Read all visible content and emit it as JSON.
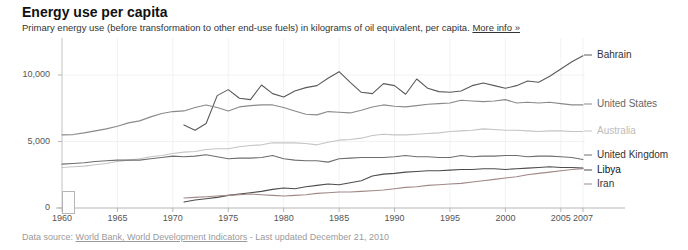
{
  "header": {
    "title": "Energy use per capita",
    "subtitle": "Primary energy use (before transformation to other end-use fuels) in kilograms of oil equivalent, per capita.",
    "more_info": "More info »"
  },
  "footer": {
    "prefix": "Data source:",
    "source_link": "World Bank, World Development Indicators",
    "updated": "- Last updated December 21, 2010"
  },
  "controls": {
    "range_handle": "range-slider-handle"
  },
  "chart_data": {
    "type": "line",
    "title": "Energy use per capita",
    "xlabel": "",
    "ylabel": "kg of oil equivalent per capita",
    "xlim": [
      1960,
      2007
    ],
    "ylim": [
      0,
      12000
    ],
    "yticks": [
      0,
      5000,
      10000
    ],
    "ytick_labels": [
      "0",
      "5,000",
      "10,000"
    ],
    "xticks": [
      1960,
      1965,
      1970,
      1975,
      1980,
      1985,
      1990,
      1995,
      2000,
      2005,
      2007
    ],
    "xtick_labels": [
      "1960",
      "1965",
      "1970",
      "1975",
      "1980",
      "1985",
      "1990",
      "1995",
      "2000",
      "2005",
      "2007"
    ],
    "grid": true,
    "legend_position": "right-inline",
    "series": [
      {
        "name": "Bahrain",
        "color": "#5a5a5a",
        "label_color": "#333333",
        "label_y": 55,
        "x": [
          1971,
          1972,
          1973,
          1974,
          1975,
          1976,
          1977,
          1978,
          1979,
          1980,
          1981,
          1982,
          1983,
          1984,
          1985,
          1986,
          1987,
          1988,
          1989,
          1990,
          1991,
          1992,
          1993,
          1994,
          1995,
          1996,
          1997,
          1998,
          1999,
          2000,
          2001,
          2002,
          2003,
          2004,
          2005,
          2006,
          2007
        ],
        "values": [
          6250,
          5850,
          6350,
          8450,
          8900,
          8250,
          8150,
          9250,
          8600,
          8350,
          8800,
          9050,
          9200,
          9750,
          10250,
          9450,
          8700,
          8600,
          9350,
          9200,
          8550,
          9700,
          9000,
          8750,
          8700,
          8800,
          9200,
          9400,
          9200,
          9000,
          9200,
          9550,
          9450,
          9900,
          10450,
          11000,
          11450
        ]
      },
      {
        "name": "United States",
        "color": "#8a8a8a",
        "label_color": "#666666",
        "label_y": 104,
        "x": [
          1960,
          1961,
          1962,
          1963,
          1964,
          1965,
          1966,
          1967,
          1968,
          1969,
          1970,
          1971,
          1972,
          1973,
          1974,
          1975,
          1976,
          1977,
          1978,
          1979,
          1980,
          1981,
          1982,
          1983,
          1984,
          1985,
          1986,
          1987,
          1988,
          1989,
          1990,
          1991,
          1992,
          1993,
          1994,
          1995,
          1996,
          1997,
          1998,
          1999,
          2000,
          2001,
          2002,
          2003,
          2004,
          2005,
          2006,
          2007
        ],
        "values": [
          5500,
          5520,
          5650,
          5800,
          5950,
          6150,
          6400,
          6550,
          6850,
          7100,
          7250,
          7300,
          7550,
          7750,
          7550,
          7300,
          7600,
          7700,
          7750,
          7750,
          7550,
          7300,
          7050,
          7000,
          7250,
          7200,
          7150,
          7350,
          7600,
          7750,
          7650,
          7600,
          7700,
          7800,
          7850,
          7900,
          8100,
          8050,
          8000,
          8050,
          8150,
          7900,
          7950,
          7900,
          7950,
          7850,
          7750,
          7750
        ]
      },
      {
        "name": "Australia",
        "color": "#c4c4c4",
        "label_color": "#bcbcbc",
        "label_y": 131,
        "x": [
          1960,
          1961,
          1962,
          1963,
          1964,
          1965,
          1966,
          1967,
          1968,
          1969,
          1970,
          1971,
          1972,
          1973,
          1974,
          1975,
          1976,
          1977,
          1978,
          1979,
          1980,
          1981,
          1982,
          1983,
          1984,
          1985,
          1986,
          1987,
          1988,
          1989,
          1990,
          1991,
          1992,
          1993,
          1994,
          1995,
          1996,
          1997,
          1998,
          1999,
          2000,
          2001,
          2002,
          2003,
          2004,
          2005,
          2006,
          2007
        ],
        "values": [
          3050,
          3100,
          3150,
          3250,
          3350,
          3500,
          3600,
          3700,
          3850,
          3950,
          4100,
          4200,
          4250,
          4400,
          4450,
          4450,
          4600,
          4700,
          4750,
          4900,
          4900,
          4900,
          4850,
          4750,
          4950,
          5100,
          5150,
          5250,
          5450,
          5550,
          5500,
          5500,
          5550,
          5600,
          5650,
          5750,
          5800,
          5850,
          5950,
          5900,
          5850,
          5850,
          5800,
          5750,
          5800,
          5800,
          5750,
          5750
        ]
      },
      {
        "name": "United Kingdom",
        "color": "#6e6e6e",
        "label_color": "#333333",
        "label_y": 155,
        "x": [
          1960,
          1961,
          1962,
          1963,
          1964,
          1965,
          1966,
          1967,
          1968,
          1969,
          1970,
          1971,
          1972,
          1973,
          1974,
          1975,
          1976,
          1977,
          1978,
          1979,
          1980,
          1981,
          1982,
          1983,
          1984,
          1985,
          1986,
          1987,
          1988,
          1989,
          1990,
          1991,
          1992,
          1993,
          1994,
          1995,
          1996,
          1997,
          1998,
          1999,
          2000,
          2001,
          2002,
          2003,
          2004,
          2005,
          2006,
          2007
        ],
        "values": [
          3300,
          3350,
          3400,
          3500,
          3550,
          3600,
          3600,
          3600,
          3700,
          3800,
          3900,
          3850,
          3900,
          4000,
          3850,
          3700,
          3750,
          3750,
          3800,
          3950,
          3700,
          3600,
          3550,
          3550,
          3450,
          3700,
          3750,
          3800,
          3800,
          3800,
          3850,
          3950,
          3850,
          3850,
          3800,
          3800,
          3950,
          3850,
          3900,
          3900,
          3950,
          3950,
          3850,
          3900,
          3900,
          3850,
          3800,
          3650
        ]
      },
      {
        "name": "Libya",
        "color": "#4d4d4d",
        "label_color": "#111111",
        "label_y": 170,
        "x": [
          1971,
          1972,
          1973,
          1974,
          1975,
          1976,
          1977,
          1978,
          1979,
          1980,
          1981,
          1982,
          1983,
          1984,
          1985,
          1986,
          1987,
          1988,
          1989,
          1990,
          1991,
          1992,
          1993,
          1994,
          1995,
          1996,
          1997,
          1998,
          1999,
          2000,
          2001,
          2002,
          2003,
          2004,
          2005,
          2006,
          2007
        ],
        "values": [
          450,
          600,
          700,
          800,
          950,
          1050,
          1150,
          1250,
          1400,
          1500,
          1450,
          1600,
          1700,
          1800,
          1750,
          1900,
          2050,
          2400,
          2550,
          2600,
          2700,
          2750,
          2800,
          2800,
          2850,
          2900,
          2900,
          2950,
          2950,
          2900,
          2950,
          3000,
          3050,
          3100,
          3050,
          3050,
          3000
        ]
      },
      {
        "name": "Iran",
        "color": "#a08888",
        "label_color": "#333333",
        "label_y": 184,
        "x": [
          1971,
          1972,
          1973,
          1974,
          1975,
          1976,
          1977,
          1978,
          1979,
          1980,
          1981,
          1982,
          1983,
          1984,
          1985,
          1986,
          1987,
          1988,
          1989,
          1990,
          1991,
          1992,
          1993,
          1994,
          1995,
          1996,
          1997,
          1998,
          1999,
          2000,
          2001,
          2002,
          2003,
          2004,
          2005,
          2006,
          2007
        ],
        "values": [
          750,
          800,
          850,
          900,
          950,
          1000,
          1050,
          1000,
          950,
          900,
          950,
          1000,
          1100,
          1150,
          1200,
          1200,
          1250,
          1300,
          1350,
          1450,
          1550,
          1600,
          1700,
          1750,
          1800,
          1850,
          1950,
          2050,
          2150,
          2250,
          2350,
          2500,
          2600,
          2700,
          2800,
          2900,
          2950
        ]
      }
    ]
  }
}
